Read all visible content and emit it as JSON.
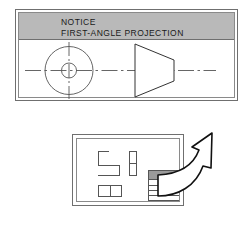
{
  "notice": {
    "title": "NOTICE",
    "subtitle": "FIRST-ANGLE PROJECTION",
    "banner_color": "#b9b9b9",
    "border_color": "#6f6f6f",
    "symbol": {
      "name": "first-angle-projection-symbol",
      "elements": [
        "circle-view",
        "concentric-inner-circle",
        "crosshair-centerlines",
        "truncated-cone-view",
        "horizontal-centerline"
      ]
    }
  },
  "sheet": {
    "name": "drawing-sheet",
    "border_color": "#6f6f6f",
    "shapes": [
      {
        "name": "l-shaped-block"
      },
      {
        "name": "vertical-divided-bar"
      },
      {
        "name": "wide-divided-rectangle"
      }
    ],
    "title_block": {
      "name": "title-block",
      "header_fill": "#9a9a9a",
      "rule_count": 4
    }
  },
  "arrow": {
    "name": "callout-arrow",
    "direction": "up-right",
    "style": "curved-outline",
    "fill": "#ffffff",
    "stroke": "#111111"
  },
  "colors": {
    "background": "#ffffff",
    "line": "#555555",
    "text": "#1a1a1a"
  }
}
